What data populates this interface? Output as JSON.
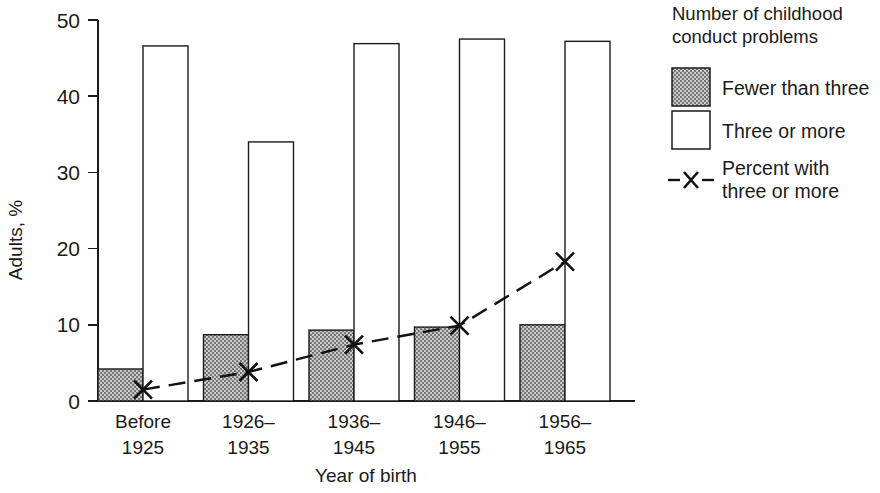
{
  "chart_data": {
    "type": "bar",
    "title": "",
    "xlabel": "Year of birth",
    "ylabel": "Adults, %",
    "ylim": [
      0,
      50
    ],
    "yticks": [
      0,
      10,
      20,
      30,
      40,
      50
    ],
    "ytick_labels": [
      "0",
      "10",
      "20",
      "30",
      "40",
      "50"
    ],
    "grid": false,
    "legend_position": "right",
    "categories": [
      "Before\n1925",
      "1926–\n1935",
      "1936–\n1945",
      "1946–\n1955",
      "1956–\n1965"
    ],
    "category_lines": [
      [
        "Before",
        "1925"
      ],
      [
        "1926–",
        "1935"
      ],
      [
        "1936–",
        "1945"
      ],
      [
        "1946–",
        "1955"
      ],
      [
        "1956–",
        "1965"
      ]
    ],
    "series": [
      {
        "name": "Fewer than three",
        "kind": "bar",
        "style": "shaded",
        "values": [
          4.2,
          8.7,
          9.3,
          9.7,
          10.0
        ]
      },
      {
        "name": "Three or more",
        "kind": "bar",
        "style": "open",
        "values": [
          46.6,
          34.0,
          46.9,
          47.5,
          47.2
        ]
      },
      {
        "name": "Percent with three or more",
        "kind": "line",
        "style": "dashed-x",
        "values": [
          1.5,
          3.8,
          7.4,
          9.9,
          18.3
        ]
      }
    ]
  },
  "legend": {
    "title_lines": [
      "Number of childhood",
      "conduct problems"
    ],
    "entries": [
      {
        "label_lines": [
          "Fewer than three"
        ],
        "marker": "shaded-square-swatch"
      },
      {
        "label_lines": [
          "Three or more"
        ],
        "marker": "open-square-swatch"
      },
      {
        "label_lines": [
          "Percent with",
          "three or more"
        ],
        "marker": "dashed-x-line-swatch"
      }
    ]
  },
  "colors": {
    "ink": "#1a1a1a",
    "shaded_fill": "#9a9a9a",
    "open_fill": "#ffffff",
    "line": "#111111",
    "background": "#ffffff"
  },
  "geometry": {
    "plot_left": 98,
    "plot_right": 635,
    "plot_bottom": 401,
    "plot_top": 20,
    "y_axis_x": 98,
    "bar_width": 45,
    "group_span": 105.5,
    "group_start": 98
  }
}
